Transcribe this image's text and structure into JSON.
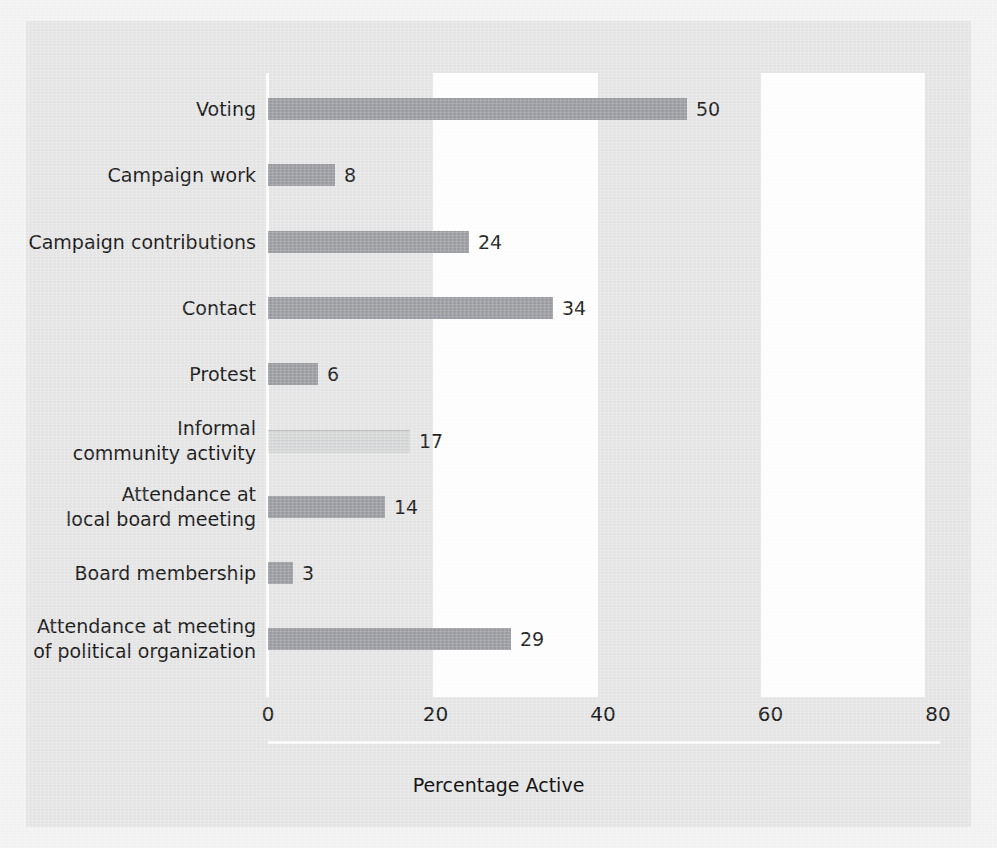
{
  "chart_data": {
    "type": "bar",
    "orientation": "horizontal",
    "title": "",
    "xlabel": "Percentage Active",
    "ylabel": "",
    "xlim": [
      0,
      80
    ],
    "xticks": [
      0,
      20,
      40,
      60,
      80
    ],
    "xtick_labels": [
      "0",
      "20",
      "40",
      "60",
      "80"
    ],
    "grid": false,
    "legend": null,
    "bar_color": "#9b9da2",
    "background_color": "#e6e6e6",
    "categories": [
      "Voting",
      "Campaign work",
      "Campaign contributions",
      "Contact",
      "Protest",
      "Informal\ncommunity activity",
      "Attendance at\nlocal board meeting",
      "Board membership",
      "Attendance at meeting\nof political organization"
    ],
    "values": [
      50,
      8,
      24,
      34,
      6,
      17,
      14,
      3,
      29
    ],
    "value_labels": [
      "50",
      "8",
      "24",
      "34",
      "6",
      "17",
      "14",
      "3",
      "29"
    ]
  },
  "axis": {
    "x_title": "Percentage Active"
  }
}
